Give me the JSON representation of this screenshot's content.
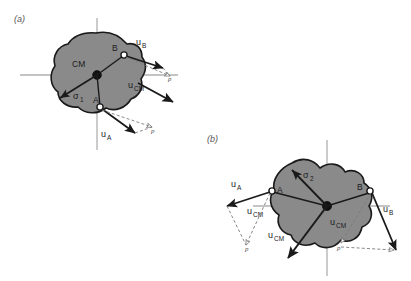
{
  "figure": {
    "background_color": "#ffffff",
    "blob_fill": "#8a8a8a",
    "blob_stroke": "#1a1a1a",
    "axis_color": "#b0b0b0",
    "vector_color": "#1a1a1a",
    "dashed_color": "#7a7a7a",
    "width": 411,
    "height": 281
  },
  "panels": [
    {
      "id": "a",
      "label": "(a)",
      "cm_label": "CM",
      "sigma_base": "σ",
      "sigma_sub": "1",
      "points": [
        {
          "name": "B",
          "label": "B"
        },
        {
          "name": "A",
          "label": "A"
        }
      ],
      "vectors": [
        {
          "name": "u_B",
          "base": "u",
          "sub": "B"
        },
        {
          "name": "u_CM",
          "base": "u",
          "sub": "CM"
        },
        {
          "name": "u_A",
          "base": "u",
          "sub": "A"
        }
      ],
      "dashed_markers": [
        "p",
        "p"
      ]
    },
    {
      "id": "b",
      "label": "(b)",
      "cm_label": "",
      "sigma_base": "σ",
      "sigma_sub": "2",
      "points": [
        {
          "name": "A",
          "label": "A"
        },
        {
          "name": "B",
          "label": "B"
        }
      ],
      "vectors": [
        {
          "name": "u_A",
          "base": "u",
          "sub": "A"
        },
        {
          "name": "u_CM_left",
          "base": "u",
          "sub": "CM"
        },
        {
          "name": "u_CM_mid",
          "base": "u",
          "sub": "CM"
        },
        {
          "name": "u_CM_right",
          "base": "u",
          "sub": "CM"
        },
        {
          "name": "u_B",
          "base": "u",
          "sub": "B"
        }
      ],
      "dashed_markers": [
        "p",
        "p"
      ]
    }
  ]
}
